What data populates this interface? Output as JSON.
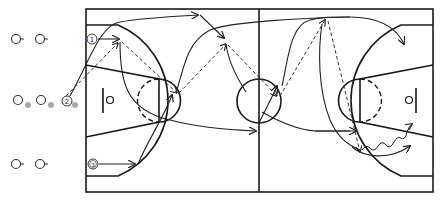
{
  "diagram": {
    "type": "basketball-play-diagram",
    "court": {
      "left": 86,
      "top": 9,
      "right": 433,
      "bottom": 192,
      "midcourt_x": 259,
      "line_color": "#1a1a1a"
    },
    "players": [
      {
        "label": "1",
        "x": 92,
        "y": 39
      },
      {
        "label": "2",
        "x": 67,
        "y": 101
      },
      {
        "label": "3",
        "x": 93,
        "y": 164
      }
    ],
    "queues": [
      {
        "lane": "top",
        "players": [
          {
            "x": 16,
            "y": 39
          },
          {
            "x": 40,
            "y": 39
          }
        ],
        "has_ball": false
      },
      {
        "lane": "middle",
        "players": [
          {
            "x": 18,
            "y": 100
          },
          {
            "x": 41,
            "y": 100
          }
        ],
        "has_ball": true
      },
      {
        "lane": "bottom",
        "players": [
          {
            "x": 16,
            "y": 164
          },
          {
            "x": 40,
            "y": 164
          }
        ],
        "has_ball": false
      }
    ],
    "legend": {
      "solid_arrow": "player cut",
      "dashed_arrow": "pass",
      "wavy_arrow": "dribble",
      "gray_dot": "ball"
    },
    "colors": {
      "lines": "#1a1a1a",
      "ball": "#a9a9a9",
      "background": "#ffffff"
    }
  }
}
